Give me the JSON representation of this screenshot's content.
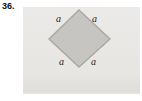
{
  "problem": {
    "number": "36."
  },
  "figure": {
    "side_labels": {
      "top_left": "a",
      "top_right": "a",
      "bottom_left": "a",
      "bottom_right": "a"
    }
  },
  "colors": {
    "page_bg": "#ffffff",
    "rect_fill": "#e8e6e3",
    "diamond_fill": "#c6c5c2",
    "diamond_stroke": "#a9a8a4",
    "label_color": "#1c1c1c",
    "number_color": "#101010"
  }
}
